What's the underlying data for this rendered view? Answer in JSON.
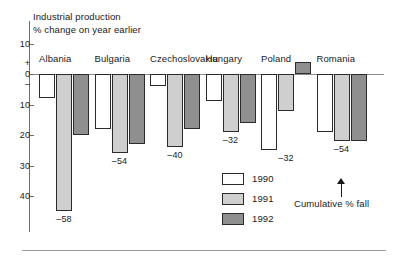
{
  "chart_data": {
    "type": "bar",
    "title": "Industrial production",
    "subtitle": "% change on year earlier",
    "xlabel": "",
    "ylabel": "",
    "ylim": [
      -45,
      13
    ],
    "grid": false,
    "legend_position": "bottom-center",
    "axis_orientation": "inverted-negative-downward",
    "y_ticks": [
      {
        "label": "10",
        "value": 10
      },
      {
        "label": "0",
        "value": 0
      },
      {
        "label": "10",
        "value": -10
      },
      {
        "label": "20",
        "value": -20
      },
      {
        "label": "30",
        "value": -30
      },
      {
        "label": "40",
        "value": -40
      }
    ],
    "y_sign_marks": {
      "positive": "+",
      "negative": "–"
    },
    "categories": [
      "Albania",
      "Bulgaria",
      "Czechoslovakia",
      "Hungary",
      "Poland",
      "Romania"
    ],
    "series": [
      {
        "name": "1990",
        "values": [
          -8,
          -18,
          -4,
          -9,
          -25,
          -19
        ]
      },
      {
        "name": "1991",
        "values": [
          -45,
          -26,
          -24,
          -19,
          -12,
          -22
        ]
      },
      {
        "name": "1992",
        "values": [
          -20,
          -23,
          -18,
          -16,
          4,
          -22
        ]
      }
    ],
    "annotations": {
      "cumulative_label": "Cumulative % fall",
      "cumulative_values": [
        {
          "category": "Albania",
          "label": "–58",
          "value": -58
        },
        {
          "category": "Bulgaria",
          "label": "–54",
          "value": -54
        },
        {
          "category": "Czechoslovakia",
          "label": "–40",
          "value": -40
        },
        {
          "category": "Hungary",
          "label": "–32",
          "value": -32
        },
        {
          "category": "Poland",
          "label": "–32",
          "value": -32
        },
        {
          "category": "Romania",
          "label": "–54",
          "value": -54
        }
      ]
    },
    "colors": {
      "1990": "#ffffff",
      "1991": "#cfcfcf",
      "1992": "#8f8f8f",
      "bar_outline": "#2b2b2b",
      "axis": "#6e6e6e",
      "text": "#1a1a1a",
      "background": "#ffffff"
    }
  },
  "legend": {
    "items": [
      {
        "label": "1990",
        "key": "y1990"
      },
      {
        "label": "1991",
        "key": "y1991"
      },
      {
        "label": "1992",
        "key": "y1992"
      }
    ]
  }
}
